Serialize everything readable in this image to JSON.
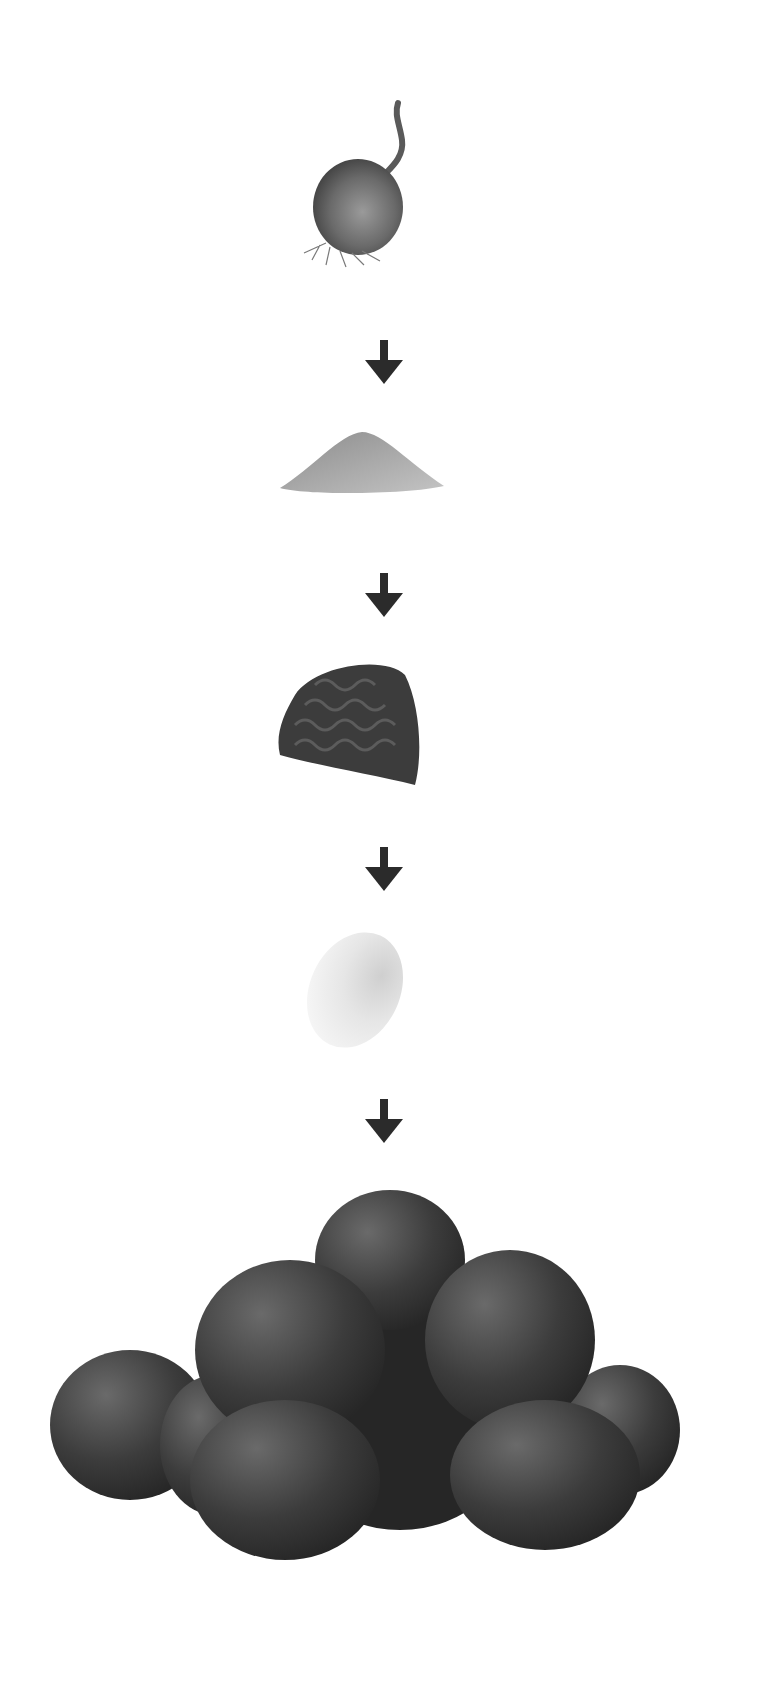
{
  "diagram": {
    "type": "process-flow",
    "direction": "top-to-bottom",
    "steps": [
      {
        "label": "onion",
        "icon": "onion-image"
      },
      {
        "label": "breadcrumbs",
        "icon": "breadcrumb-pile-image"
      },
      {
        "label": "minced meat",
        "icon": "minced-meat-image"
      },
      {
        "label": "egg",
        "icon": "egg-image"
      },
      {
        "label": "meatballs",
        "icon": "meatballs-image"
      }
    ],
    "connectors": [
      {
        "from": "onion",
        "to": "breadcrumbs",
        "icon": "arrow-down-icon"
      },
      {
        "from": "breadcrumbs",
        "to": "minced meat",
        "icon": "arrow-down-icon"
      },
      {
        "from": "minced meat",
        "to": "egg",
        "icon": "arrow-down-icon"
      },
      {
        "from": "egg",
        "to": "meatballs",
        "icon": "arrow-down-icon"
      }
    ]
  },
  "colors": {
    "background": "#ffffff",
    "arrow": "#2b2b2b",
    "onion": "#6e6e6e",
    "breadcrumbs": "#a9a9a9",
    "minced_meat": "#3c3c3c",
    "egg": "#e6e6e6",
    "meatballs": "#3a3a3a"
  }
}
